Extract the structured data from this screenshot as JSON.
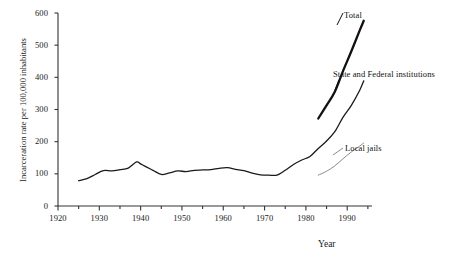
{
  "chart_data": {
    "type": "line",
    "title": "",
    "xlabel": "Year",
    "ylabel": "Incarceration rate per 100,000 inhabitants",
    "xlim": [
      1920,
      1996
    ],
    "ylim": [
      0,
      600
    ],
    "xticks": [
      1920,
      1925,
      1930,
      1935,
      1940,
      1945,
      1950,
      1955,
      1960,
      1965,
      1970,
      1975,
      1980,
      1985,
      1990,
      1995
    ],
    "xtick_labels": [
      "1920",
      "",
      "1930",
      "",
      "1940",
      "",
      "1950",
      "",
      "1960",
      "",
      "1970",
      "",
      "1980",
      "",
      "1990",
      ""
    ],
    "xtick_labels_major": [
      "1920",
      "1930",
      "1940",
      "1950",
      "1960",
      "1970",
      "1980",
      "1990"
    ],
    "yticks": [
      0,
      100,
      200,
      300,
      400,
      500,
      600
    ],
    "ytick_labels": [
      "0",
      "100",
      "200",
      "300",
      "400",
      "500",
      "600"
    ],
    "grid": false,
    "legend": "inline-annotations",
    "series": [
      {
        "name": "State and Federal institutions",
        "style": "solid-thin",
        "color": "#1a1a1a",
        "x": [
          1925,
          1927,
          1929,
          1931,
          1933,
          1935,
          1937,
          1939,
          1940,
          1941,
          1943,
          1945,
          1947,
          1949,
          1951,
          1953,
          1955,
          1957,
          1959,
          1961,
          1963,
          1965,
          1967,
          1969,
          1971,
          1973,
          1975,
          1977,
          1979,
          1981,
          1983,
          1985,
          1987,
          1989,
          1991,
          1993,
          1994
        ],
        "values": [
          79,
          85,
          98,
          110,
          109,
          113,
          118,
          137,
          131,
          124,
          111,
          98,
          103,
          109,
          107,
          111,
          112,
          113,
          117,
          119,
          114,
          110,
          102,
          97,
          96,
          96,
          111,
          129,
          143,
          154,
          179,
          202,
          231,
          276,
          313,
          359,
          389
        ]
      },
      {
        "name": "Total",
        "style": "solid-thick",
        "color": "#111111",
        "x": [
          1983,
          1985,
          1987,
          1989,
          1991,
          1993,
          1994
        ],
        "values": [
          272,
          313,
          355,
          420,
          481,
          545,
          576
        ]
      },
      {
        "name": "Local jails",
        "style": "solid-light",
        "color": "#8a8a8a",
        "x": [
          1983,
          1985,
          1987,
          1989,
          1991,
          1993,
          1994
        ],
        "values": [
          96,
          108,
          125,
          147,
          168,
          186,
          196
        ]
      }
    ]
  },
  "axes": {
    "y_title": "Incarceration rate per 100,000 inhabitants",
    "x_title": "Year"
  },
  "annotations": {
    "total": "Total",
    "state_federal": "State and Federal institutions",
    "local_jails": "Local jails"
  },
  "colors": {
    "background": "#ffffff",
    "axis": "#333333",
    "total_line": "#111111",
    "state_line": "#1a1a1a",
    "local_line": "#8a8a8a",
    "text": "#111111"
  }
}
